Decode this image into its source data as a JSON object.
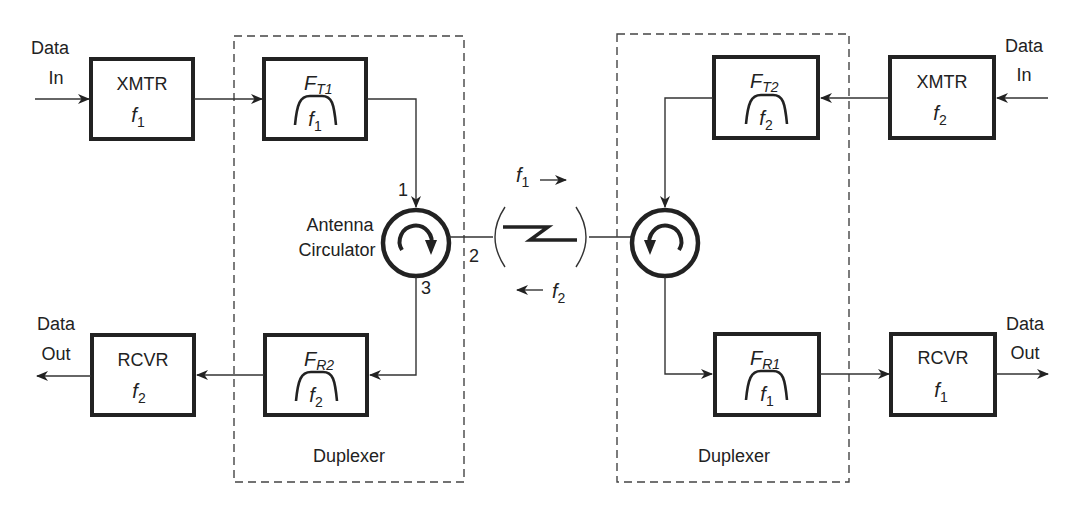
{
  "diagram": {
    "type": "full-duplex FDD link with duplexers and antenna circulators",
    "left_station": {
      "data_in_label_line1": "Data",
      "data_in_label_line2": "In",
      "data_out_label_line1": "Data",
      "data_out_label_line2": "Out",
      "transmitter": {
        "label": "XMTR",
        "freq": "f",
        "freq_sub": "1"
      },
      "tx_filter": {
        "name": "F",
        "name_sub": "T1",
        "freq": "f",
        "freq_sub": "1"
      },
      "receiver": {
        "label": "RCVR",
        "freq": "f",
        "freq_sub": "2"
      },
      "rx_filter": {
        "name": "F",
        "name_sub": "R2",
        "freq": "f",
        "freq_sub": "2"
      },
      "circulator_label_line1": "Antenna",
      "circulator_label_line2": "Circulator",
      "port_1": "1",
      "port_2": "2",
      "port_3": "3",
      "duplexer_label": "Duplexer"
    },
    "right_station": {
      "data_in_label_line1": "Data",
      "data_in_label_line2": "In",
      "data_out_label_line1": "Data",
      "data_out_label_line2": "Out",
      "transmitter": {
        "label": "XMTR",
        "freq": "f",
        "freq_sub": "2"
      },
      "tx_filter": {
        "name": "F",
        "name_sub": "T2",
        "freq": "f",
        "freq_sub": "2"
      },
      "receiver": {
        "label": "RCVR",
        "freq": "f",
        "freq_sub": "1"
      },
      "rx_filter": {
        "name": "F",
        "name_sub": "R1",
        "freq": "f",
        "freq_sub": "1"
      },
      "duplexer_label": "Duplexer"
    },
    "link": {
      "forward": {
        "freq": "f",
        "freq_sub": "1",
        "arrow": "→"
      },
      "reverse": {
        "freq": "f",
        "freq_sub": "2",
        "arrow": "←"
      }
    },
    "colors": {
      "line": "#222222",
      "background": "#ffffff"
    }
  }
}
